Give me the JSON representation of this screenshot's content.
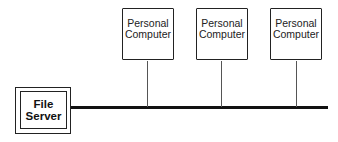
{
  "diagram": {
    "type": "network-bus-topology",
    "server": {
      "label_line1": "File",
      "label_line2": "Server"
    },
    "clients": [
      {
        "label_line1": "Personal",
        "label_line2": "Computer"
      },
      {
        "label_line1": "Personal",
        "label_line2": "Computer"
      },
      {
        "label_line1": "Personal",
        "label_line2": "Computer"
      }
    ],
    "colors": {
      "line": "#111111",
      "background": "#ffffff"
    }
  }
}
